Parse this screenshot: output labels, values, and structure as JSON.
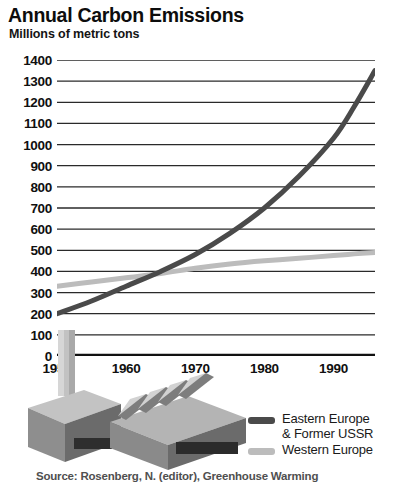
{
  "chart_data": {
    "type": "line",
    "title": "Annual Carbon Emissions",
    "subtitle": "Millions of metric tons",
    "xlabel": "",
    "ylabel": "Millions of metric tons",
    "xlim": [
      1950,
      1996
    ],
    "ylim": [
      0,
      1400
    ],
    "ytick_step": 100,
    "yticks": [
      1400,
      1300,
      1200,
      1100,
      1000,
      900,
      800,
      700,
      600,
      500,
      400,
      300,
      200,
      100,
      0
    ],
    "ytick_labels": [
      "1400",
      "1300",
      "1200",
      "1100",
      "1000",
      "900",
      "800",
      "700",
      "600",
      "500",
      "400",
      "300",
      "200",
      "100",
      "0"
    ],
    "xticks": [
      1950,
      1960,
      1970,
      1980,
      1990
    ],
    "xtick_labels": [
      "1950",
      "1960",
      "1970",
      "1980",
      "1990"
    ],
    "x_minor_tick_step": 5,
    "grid": "horizontal",
    "legend_position": "bottom-right",
    "series": [
      {
        "name": "Eastern Europe & Former USSR",
        "color": "#4a4a4a",
        "x": [
          1950,
          1955,
          1960,
          1965,
          1970,
          1975,
          1980,
          1985,
          1990,
          1993,
          1996
        ],
        "values": [
          200,
          260,
          330,
          400,
          480,
          580,
          700,
          850,
          1030,
          1180,
          1350
        ]
      },
      {
        "name": "Western Europe",
        "color": "#bcbcbc",
        "x": [
          1950,
          1955,
          1960,
          1965,
          1970,
          1975,
          1980,
          1985,
          1990,
          1993,
          1996
        ],
        "values": [
          330,
          350,
          370,
          390,
          415,
          435,
          450,
          462,
          475,
          483,
          490
        ]
      }
    ]
  },
  "legend": {
    "items": [
      {
        "label_line1": "Eastern Europe",
        "label_line2": "& Former USSR",
        "color": "#4a4a4a"
      },
      {
        "label_line1": "Western Europe",
        "label_line2": "",
        "color": "#bcbcbc"
      }
    ]
  },
  "source": {
    "text": "Source: Rosenberg, N. (editor), Greenhouse Warming"
  },
  "colors": {
    "eastern_europe": "#4a4a4a",
    "western_europe": "#bcbcbc",
    "axis": "#111111",
    "gridline": "#2a2a2a",
    "background": "#ffffff",
    "factory_light": "#c9c9c9",
    "factory_mid": "#9d9d9d",
    "factory_dark": "#6e6e6e"
  },
  "illustration": {
    "name": "factory-with-smokestack"
  }
}
